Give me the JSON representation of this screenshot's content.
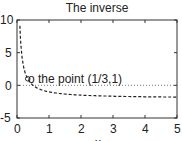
{
  "chart_data": {
    "type": "line",
    "title": "The inverse",
    "xlabel": "x",
    "ylabel": "",
    "xlim": [
      0,
      5
    ],
    "ylim": [
      -5,
      10
    ],
    "xticks": [
      "0",
      "1",
      "2",
      "3",
      "4",
      "5"
    ],
    "yticks": [
      "-5",
      "0",
      "5",
      "10"
    ],
    "grid": false,
    "series": [
      {
        "name": "1/x - 2",
        "style": "dashed",
        "x": [
          0.09,
          0.1,
          0.15,
          0.2,
          0.333,
          0.5,
          1,
          1.5,
          2,
          3,
          4,
          5
        ],
        "values": [
          9.1,
          8,
          4.67,
          3,
          1,
          0,
          -1,
          -1.33,
          -1.5,
          -1.67,
          -1.75,
          -1.8
        ]
      },
      {
        "name": "zero line",
        "style": "dotted",
        "x": [
          0,
          5
        ],
        "values": [
          0,
          0
        ]
      }
    ],
    "annotations": [
      {
        "text": "o the point (1/3,1)",
        "x": 0.333,
        "y": 1
      }
    ]
  }
}
